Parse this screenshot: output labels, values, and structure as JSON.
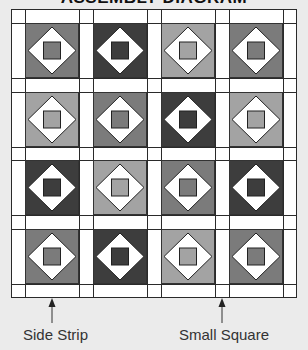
{
  "title": "ASSEMBLY DIAGRAM",
  "colors": {
    "background": "#ebebeb",
    "strip": "#ffffff",
    "outline": "#2a2a2a",
    "diamond": "#ffffff",
    "shades": {
      "dark": "#3d3d3d",
      "medium": "#7b7b7b",
      "light": "#a3a3a3"
    }
  },
  "grid": {
    "rows": 4,
    "cols": 4,
    "blocks": [
      [
        "medium",
        "dark",
        "light",
        "medium"
      ],
      [
        "light",
        "medium",
        "dark",
        "light"
      ],
      [
        "dark",
        "light",
        "medium",
        "dark"
      ],
      [
        "medium",
        "dark",
        "light",
        "medium"
      ]
    ]
  },
  "labels": {
    "side_strip": "Side Strip",
    "small_square": "Small Square"
  }
}
